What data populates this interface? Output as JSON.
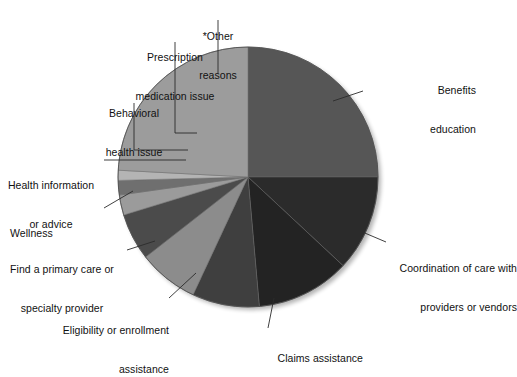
{
  "figure": {
    "background_color": "#ffffff",
    "text_color": "#111111",
    "leader_line_color": "#2b2b2b"
  },
  "chart_data": {
    "type": "pie",
    "title": "",
    "subtitle": "",
    "xlabel": "",
    "ylabel": "",
    "grid": false,
    "legend_position": "callout-labels",
    "start_angle_deg": 0,
    "direction": "clockwise",
    "center_px": [
      248,
      177
    ],
    "radius_px": 130,
    "categories": [
      "Benefits education",
      "Coordination of care with providers or vendors",
      "Claims assistance",
      "Eligibility or enrollment assistance",
      "Find a primary care or specialty provider",
      "Wellness",
      "Health information or advice",
      "Behavioral health issue",
      "Prescription medication issue",
      "*Other reasons"
    ],
    "values": [
      25.0,
      12.0,
      11.5,
      8.5,
      7.5,
      6.0,
      2.5,
      1.8,
      1.2,
      24.0
    ],
    "colors": [
      "#565656",
      "#2b2b2b",
      "#232323",
      "#3f3f3f",
      "#8c8c8c",
      "#4b4b4b",
      "#9b9b9b",
      "#6f6f6f",
      "#b4b4b4",
      "#9c9c9c"
    ],
    "slices": [
      {
        "label": "Benefits education",
        "value": 25.0,
        "start_deg": 0.0,
        "end_deg": 90.0,
        "color": "#565656"
      },
      {
        "label": "Coordination of care with providers or vendors",
        "value": 12.0,
        "start_deg": 90.0,
        "end_deg": 133.0,
        "color": "#2b2b2b"
      },
      {
        "label": "Claims assistance",
        "value": 11.5,
        "start_deg": 133.0,
        "end_deg": 175.0,
        "color": "#232323"
      },
      {
        "label": "Eligibility or enrollment assistance",
        "value": 8.5,
        "start_deg": 175.0,
        "end_deg": 205.0,
        "color": "#3f3f3f"
      },
      {
        "label": "Find a primary care or specialty provider",
        "value": 7.5,
        "start_deg": 205.0,
        "end_deg": 232.0,
        "color": "#8c8c8c"
      },
      {
        "label": "Wellness",
        "value": 6.0,
        "start_deg": 232.0,
        "end_deg": 253.0,
        "color": "#4b4b4b"
      },
      {
        "label": "Health information or advice",
        "value": 2.5,
        "start_deg": 253.0,
        "end_deg": 262.0,
        "color": "#9b9b9b"
      },
      {
        "label": "Behavioral health issue",
        "value": 1.8,
        "start_deg": 262.0,
        "end_deg": 268.5,
        "color": "#6f6f6f"
      },
      {
        "label": "Prescription medication issue",
        "value": 1.2,
        "start_deg": 268.5,
        "end_deg": 273.0,
        "color": "#b4b4b4"
      },
      {
        "label": "*Other reasons",
        "value": 24.0,
        "start_deg": 273.0,
        "end_deg": 360.0,
        "color": "#9c9c9c"
      }
    ]
  },
  "labels": {
    "other_reasons": {
      "line1": "*Other",
      "line2": "reasons"
    },
    "prescription": {
      "line1": "Prescription",
      "line2": "medication issue"
    },
    "behavioral": {
      "line1": "Behavioral",
      "line2": "health issue"
    },
    "health_information": {
      "line1": "Health information",
      "line2": "or advice"
    },
    "wellness": {
      "line1": "Wellness",
      "line2": ""
    },
    "find_provider": {
      "line1": "Find a primary care or",
      "line2": "specialty provider"
    },
    "eligibility": {
      "line1": "Eligibility or enrollment",
      "line2": "assistance"
    },
    "claims": {
      "line1": "Claims assistance",
      "line2": ""
    },
    "coordination": {
      "line1": "Coordination of care with",
      "line2": "providers or vendors"
    },
    "benefits": {
      "line1": "Benefits",
      "line2": "education"
    }
  }
}
